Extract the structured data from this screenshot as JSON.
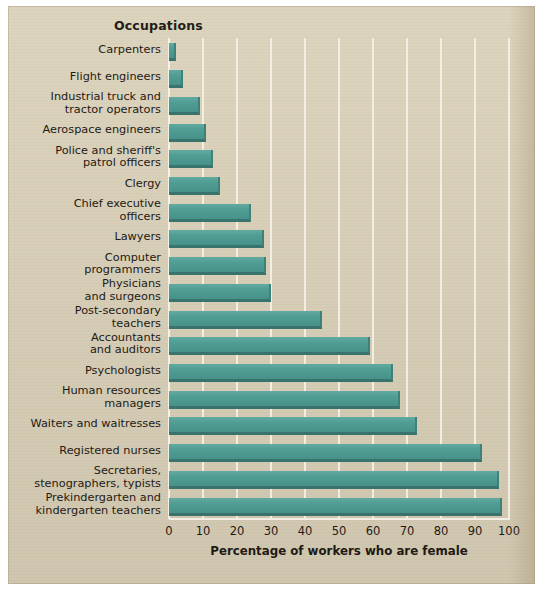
{
  "figure": {
    "column_header": "Occupations",
    "background_color": "#d9cfb7",
    "bar_color": "#4f9d93",
    "bar_shadow_color": "#38736c",
    "gridline_color": "#f3efe4"
  },
  "chart_data": {
    "type": "bar",
    "orientation": "horizontal",
    "title": "",
    "xlabel": "Percentage of workers who are female",
    "ylabel": "Occupations",
    "xlim": [
      0,
      100
    ],
    "xticks": [
      0,
      10,
      20,
      30,
      40,
      50,
      60,
      70,
      80,
      90,
      100
    ],
    "grid": true,
    "legend": "none",
    "categories": [
      "Carpenters",
      "Flight engineers",
      "Industrial truck and tractor operators",
      "Aerospace engineers",
      "Police and sheriff's patrol officers",
      "Clergy",
      "Chief executive officers",
      "Lawyers",
      "Computer programmers",
      "Physicians and surgeons",
      "Post-secondary teachers",
      "Accountants and auditors",
      "Psychologists",
      "Human resources managers",
      "Waiters and waitresses",
      "Registered nurses",
      "Secretaries, stenographers, typists",
      "Prekindergarten and kindergarten teachers"
    ],
    "category_lines": [
      [
        "Carpenters"
      ],
      [
        "Flight engineers"
      ],
      [
        "Industrial truck and",
        "tractor operators"
      ],
      [
        "Aerospace engineers"
      ],
      [
        "Police and sheriff's",
        "patrol officers"
      ],
      [
        "Clergy"
      ],
      [
        "Chief executive",
        "officers"
      ],
      [
        "Lawyers"
      ],
      [
        "Computer",
        "programmers"
      ],
      [
        "Physicians",
        "and surgeons"
      ],
      [
        "Post-secondary",
        "teachers"
      ],
      [
        "Accountants",
        "and auditors"
      ],
      [
        "Psychologists"
      ],
      [
        "Human resources",
        "managers"
      ],
      [
        "Waiters and waitresses"
      ],
      [
        "Registered nurses"
      ],
      [
        "Secretaries,",
        "stenographers, typists"
      ],
      [
        "Prekindergarten and",
        "kindergarten teachers"
      ]
    ],
    "values": [
      2,
      4,
      9,
      11,
      13,
      15,
      24,
      28,
      28.5,
      30,
      45,
      59,
      66,
      68,
      73,
      92,
      97,
      98
    ]
  }
}
